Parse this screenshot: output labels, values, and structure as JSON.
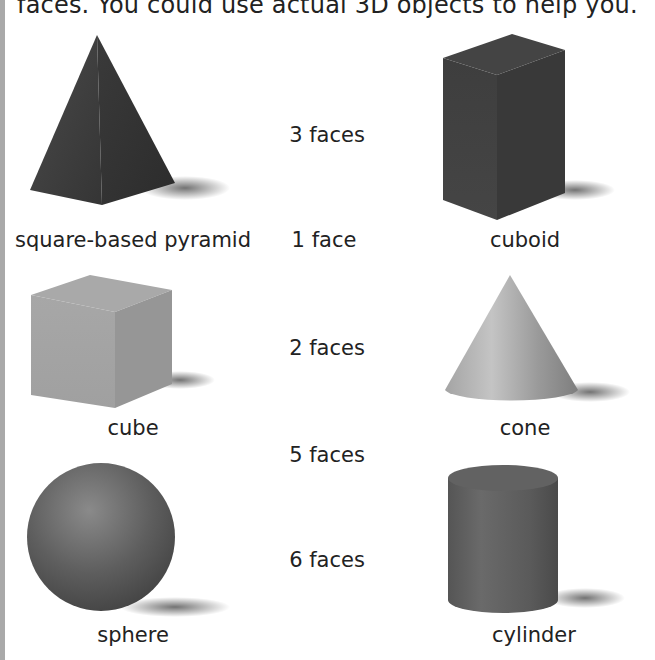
{
  "instruction": "faces. You could use actual 3D objects to help you.",
  "shapes": [
    {
      "id": "pyramid",
      "label": "square-based pyramid"
    },
    {
      "id": "cuboid",
      "label": "cuboid"
    },
    {
      "id": "cube",
      "label": "cube"
    },
    {
      "id": "cone",
      "label": "cone"
    },
    {
      "id": "sphere",
      "label": "sphere"
    },
    {
      "id": "cylinder",
      "label": "cylinder"
    }
  ],
  "face_counts": [
    "3 faces",
    "1 face",
    "2 faces",
    "5 faces",
    "6 faces"
  ],
  "colors": {
    "border": "#a9a9a9",
    "dark_shape": "#3c3c3c",
    "light_shape": "#a8a8a8",
    "text": "#222222"
  }
}
